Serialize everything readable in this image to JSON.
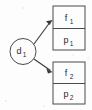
{
  "diagram": {
    "background_color": "#fdfdfd",
    "line_color": "#4a4a4a",
    "text_color": "#2b2b2b",
    "source_node": {
      "id": "d1",
      "shape": "ellipse",
      "base_label": "d",
      "subscript": "1"
    },
    "records": [
      {
        "id": "record-1",
        "shape": "rectangle",
        "cells": [
          {
            "id": "f1",
            "base_label": "f",
            "subscript": "1"
          },
          {
            "id": "p1",
            "base_label": "p",
            "subscript": "1"
          }
        ]
      },
      {
        "id": "record-2",
        "shape": "rectangle",
        "cells": [
          {
            "id": "f2",
            "base_label": "f",
            "subscript": "2"
          },
          {
            "id": "p2",
            "base_label": "p",
            "subscript": "2"
          }
        ]
      }
    ],
    "edges": [
      {
        "id": "edge-d1-to-record-1",
        "from": "d1",
        "to": "record-1",
        "arrowhead": true,
        "label": ""
      },
      {
        "id": "edge-d1-to-record-2",
        "from": "d1",
        "to": "record-2",
        "arrowhead": true,
        "label": ""
      }
    ]
  }
}
